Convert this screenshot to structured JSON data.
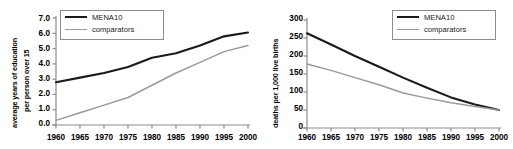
{
  "figure": {
    "panels": [
      "left",
      "right"
    ],
    "series_colors": {
      "mena10": "#1a1a1a",
      "comparators": "#9a9a9a"
    }
  },
  "left": {
    "legend": {
      "items": [
        {
          "label": "MENA10",
          "key": "mena10"
        },
        {
          "label": "comparators",
          "key": "comparators"
        }
      ]
    },
    "ylabel_line1": "average years of education",
    "ylabel_line2": "per person over 15",
    "yticks": [
      "0.0",
      "1.0",
      "2.0",
      "3.0",
      "4.0",
      "5.0",
      "6.0",
      "7.0"
    ],
    "xticks": [
      "1960",
      "1965",
      "1970",
      "1975",
      "1980",
      "1985",
      "1990",
      "1995",
      "2000"
    ]
  },
  "right": {
    "legend": {
      "items": [
        {
          "label": "MENA10",
          "key": "mena10"
        },
        {
          "label": "comparators",
          "key": "comparators"
        }
      ]
    },
    "ylabel_line1": "deaths per 1,000 live births",
    "yticks": [
      "0",
      "50",
      "100",
      "150",
      "200",
      "250",
      "300"
    ],
    "xticks": [
      "1960",
      "1965",
      "1970",
      "1975",
      "1980",
      "1985",
      "1990",
      "1995",
      "2000"
    ]
  },
  "chart_data": [
    {
      "type": "line",
      "panel": "left",
      "title": "",
      "xlabel": "",
      "ylabel": "average years of education per person over 15",
      "x": [
        1960,
        1965,
        1970,
        1975,
        1980,
        1985,
        1990,
        1995,
        2000
      ],
      "xlim": [
        1960,
        2000
      ],
      "ylim": [
        0.0,
        7.0
      ],
      "ytick_step": 1.0,
      "grid": false,
      "legend_position": "top-left",
      "series": [
        {
          "name": "MENA10",
          "color": "#1a1a1a",
          "values": [
            2.8,
            3.1,
            3.4,
            3.8,
            4.4,
            4.7,
            5.2,
            5.8,
            6.05
          ]
        },
        {
          "name": "comparators",
          "color": "#9a9a9a",
          "values": [
            0.3,
            0.8,
            1.3,
            1.8,
            2.6,
            3.4,
            4.1,
            4.8,
            5.2
          ]
        }
      ]
    },
    {
      "type": "line",
      "panel": "right",
      "title": "",
      "xlabel": "",
      "ylabel": "deaths per 1,000 live births",
      "x": [
        1960,
        1965,
        1970,
        1975,
        1980,
        1985,
        1990,
        1995,
        2000
      ],
      "xlim": [
        1960,
        2000
      ],
      "ylim": [
        0,
        300
      ],
      "ytick_step": 50,
      "grid": false,
      "legend_position": "top-right",
      "series": [
        {
          "name": "MENA10",
          "color": "#1a1a1a",
          "values": [
            263,
            232,
            200,
            170,
            140,
            112,
            85,
            65,
            50
          ]
        },
        {
          "name": "comparators",
          "color": "#9a9a9a",
          "values": [
            178,
            160,
            140,
            120,
            97,
            83,
            70,
            60,
            50
          ]
        }
      ]
    }
  ]
}
